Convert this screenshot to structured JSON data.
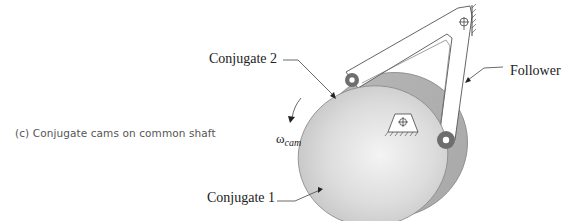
{
  "figure": {
    "caption_prefix": "(c)",
    "caption": "(c)  Conjugate cams on common shaft",
    "labels": {
      "conjugate_2": "Conjugate 2",
      "conjugate_1": "Conjugate 1",
      "follower": "Follower",
      "omega_symbol": "ω",
      "omega_subscript": "cam"
    },
    "colors": {
      "cam_front": "#d9d9d9",
      "cam_back": "#bdbdbd",
      "roller": "#6e6e6e",
      "line": "#444444"
    }
  }
}
